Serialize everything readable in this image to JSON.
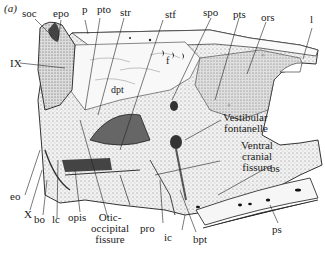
{
  "figure": {
    "panel_label": "(a)"
  },
  "labels": {
    "soc": "soc",
    "epo": "epo",
    "p": "p",
    "pto": "pto",
    "str": "str",
    "stf": "stf",
    "spo": "spo",
    "pts": "pts",
    "ors": "ors",
    "l": "l",
    "IX": "IX",
    "f": "f",
    "dpt": "dpt",
    "vestibular_1": "Vestibular",
    "vestibular_2": "fontanelle",
    "ventral_1": "Ventral",
    "ventral_2": "cranial",
    "ventral_3": "fissure",
    "bs": "bs",
    "eo": "eo",
    "X": "X",
    "bo": "bo",
    "lc": "lc",
    "opis": "opis",
    "otic_1": "Otic-",
    "otic_2": "occipital",
    "otic_3": "fissure",
    "pro": "pro",
    "ic": "ic",
    "bpt": "bpt",
    "ps": "ps"
  }
}
